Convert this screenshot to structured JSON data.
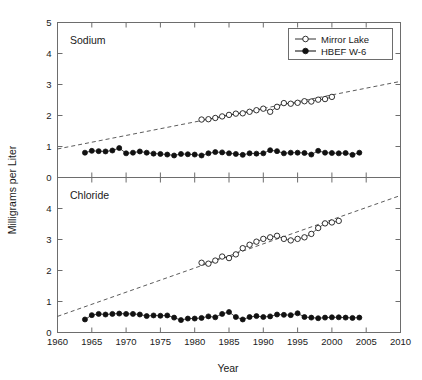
{
  "chart_data": {
    "type": "line",
    "title": "",
    "xlabel": "Year",
    "ylabel": "Milligrams per Liter",
    "xlim": [
      1960,
      2010
    ],
    "xticks": [
      1960,
      1965,
      1970,
      1975,
      1980,
      1985,
      1990,
      1995,
      2000,
      2005,
      2010
    ],
    "xticklabels": [
      "1960",
      "1965",
      "1970",
      "1975",
      "1980",
      "1985",
      "1990",
      "1995",
      "2000",
      "2005",
      "2010"
    ],
    "grid": false,
    "legend_position": "top-right of upper panel",
    "legend_entries": [
      {
        "label": "Mirror Lake",
        "marker": "open-circle",
        "color": "#111111"
      },
      {
        "label": "HBEF W-6",
        "marker": "filled-circle",
        "color": "#111111"
      }
    ],
    "panels": [
      {
        "name": "Sodium",
        "panel_label": "Sodium",
        "ylim": [
          0,
          5
        ],
        "yticks": [
          0,
          1,
          2,
          3,
          4,
          5
        ],
        "yticklabels": [
          "0",
          "1",
          "2",
          "3",
          "4",
          "5"
        ],
        "trendline": {
          "x": [
            1960,
            2010
          ],
          "y": [
            0.92,
            3.1
          ],
          "style": "dashed"
        },
        "series": [
          {
            "name": "Mirror Lake",
            "marker": "open-circle",
            "x": [
              1981,
              1982,
              1983,
              1984,
              1985,
              1986,
              1987,
              1988,
              1989,
              1990,
              1991,
              1992,
              1993,
              1994,
              1995,
              1996,
              1997,
              1998,
              1999,
              2000
            ],
            "y": [
              1.87,
              1.88,
              1.92,
              1.97,
              2.02,
              2.06,
              2.07,
              2.12,
              2.17,
              2.22,
              2.12,
              2.28,
              2.4,
              2.38,
              2.41,
              2.46,
              2.45,
              2.51,
              2.53,
              2.6
            ]
          },
          {
            "name": "HBEF W-6",
            "marker": "filled-circle",
            "x": [
              1964,
              1965,
              1966,
              1967,
              1968,
              1969,
              1970,
              1971,
              1972,
              1973,
              1974,
              1975,
              1976,
              1977,
              1978,
              1979,
              1980,
              1981,
              1982,
              1983,
              1984,
              1985,
              1986,
              1987,
              1988,
              1989,
              1990,
              1991,
              1992,
              1993,
              1994,
              1995,
              1996,
              1997,
              1998,
              1999,
              2000,
              2001,
              2002,
              2003,
              2004
            ],
            "y": [
              0.8,
              0.86,
              0.85,
              0.84,
              0.87,
              0.95,
              0.78,
              0.8,
              0.84,
              0.8,
              0.77,
              0.76,
              0.74,
              0.71,
              0.76,
              0.75,
              0.74,
              0.71,
              0.78,
              0.82,
              0.81,
              0.78,
              0.76,
              0.73,
              0.78,
              0.77,
              0.78,
              0.88,
              0.85,
              0.78,
              0.8,
              0.8,
              0.79,
              0.74,
              0.86,
              0.8,
              0.79,
              0.78,
              0.79,
              0.73,
              0.8
            ]
          }
        ]
      },
      {
        "name": "Chloride",
        "panel_label": "Chloride",
        "ylim": [
          0,
          5
        ],
        "yticks": [
          0,
          1,
          2,
          3,
          4,
          5
        ],
        "yticklabels": [
          "0",
          "1",
          "2",
          "3",
          "4",
          "5"
        ],
        "trendline": {
          "x": [
            1960,
            2010
          ],
          "y": [
            0.52,
            4.42
          ],
          "style": "dashed"
        },
        "series": [
          {
            "name": "Mirror Lake",
            "marker": "open-circle",
            "x": [
              1981,
              1982,
              1983,
              1984,
              1985,
              1986,
              1987,
              1988,
              1989,
              1990,
              1991,
              1992,
              1993,
              1994,
              1995,
              1996,
              1997,
              1998,
              1999,
              2000,
              2001
            ],
            "y": [
              2.25,
              2.22,
              2.32,
              2.45,
              2.4,
              2.52,
              2.72,
              2.83,
              2.93,
              3.02,
              3.07,
              3.12,
              3.02,
              2.97,
              3.02,
              3.07,
              3.18,
              3.37,
              3.52,
              3.55,
              3.6
            ]
          },
          {
            "name": "HBEF W-6",
            "marker": "filled-circle",
            "x": [
              1964,
              1965,
              1966,
              1967,
              1968,
              1969,
              1970,
              1971,
              1972,
              1973,
              1974,
              1975,
              1976,
              1977,
              1978,
              1979,
              1980,
              1981,
              1982,
              1983,
              1984,
              1985,
              1986,
              1987,
              1988,
              1989,
              1990,
              1991,
              1992,
              1993,
              1994,
              1995,
              1996,
              1997,
              1998,
              1999,
              2000,
              2001,
              2002,
              2003,
              2004
            ],
            "y": [
              0.42,
              0.56,
              0.6,
              0.58,
              0.6,
              0.61,
              0.6,
              0.6,
              0.58,
              0.53,
              0.55,
              0.54,
              0.55,
              0.48,
              0.4,
              0.45,
              0.45,
              0.47,
              0.52,
              0.49,
              0.6,
              0.66,
              0.5,
              0.42,
              0.5,
              0.53,
              0.5,
              0.52,
              0.58,
              0.57,
              0.56,
              0.62,
              0.5,
              0.48,
              0.46,
              0.48,
              0.49,
              0.49,
              0.48,
              0.47,
              0.48
            ]
          }
        ]
      }
    ]
  }
}
